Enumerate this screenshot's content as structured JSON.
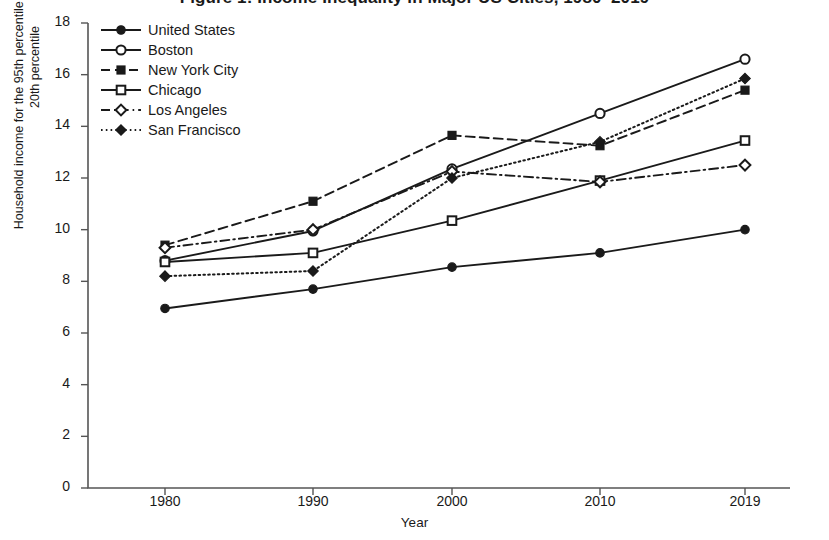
{
  "figure": {
    "title": "Figure 1: Income Inequality in Major US Cities, 1980–2019",
    "xlabel": "Year",
    "ylabel_line1": "Household income for the 95th percentile as a share of the",
    "ylabel_line2": "20th percentile"
  },
  "axes": {
    "y_ticks": [
      "18",
      "16",
      "14",
      "12",
      "10",
      "8",
      "6",
      "4",
      "2",
      "0"
    ],
    "x_ticks": [
      "1980",
      "1990",
      "2000",
      "2010",
      "2019"
    ]
  },
  "colors": {
    "line": "#1a1a1a",
    "background": "#ffffff",
    "axis": "#555555",
    "text": "#1a1a1a"
  },
  "legend": {
    "items": [
      {
        "label": "United States",
        "marker": "filled-circle",
        "dash": "solid"
      },
      {
        "label": "Boston",
        "marker": "open-circle",
        "dash": "solid"
      },
      {
        "label": "New York City",
        "marker": "filled-square",
        "dash": "dashed"
      },
      {
        "label": "Chicago",
        "marker": "open-square",
        "dash": "solid"
      },
      {
        "label": "Los Angeles",
        "marker": "open-diamond",
        "dash": "dash-dot"
      },
      {
        "label": "San Francisco",
        "marker": "filled-diamond",
        "dash": "dotted"
      }
    ]
  },
  "chart_data": {
    "type": "line",
    "title": "Figure 1: Income Inequality in Major US Cities, 1980–2019",
    "xlabel": "Year",
    "ylabel": "Household income for the 95th percentile as a share of the 20th percentile",
    "x": [
      1980,
      1990,
      2000,
      2010,
      2019
    ],
    "xtick_labels": [
      "1980",
      "1990",
      "2000",
      "2010",
      "2019"
    ],
    "ylim": [
      0,
      18
    ],
    "ytick_values": [
      0,
      2,
      4,
      6,
      8,
      10,
      12,
      14,
      16,
      18
    ],
    "grid": false,
    "legend_position": "upper-left",
    "series": [
      {
        "name": "United States",
        "marker": "filled-circle",
        "dash": "solid",
        "values": [
          6.95,
          7.7,
          8.55,
          9.1,
          10.0
        ]
      },
      {
        "name": "Boston",
        "marker": "open-circle",
        "dash": "solid",
        "values": [
          8.8,
          9.95,
          12.35,
          14.5,
          16.6
        ]
      },
      {
        "name": "New York City",
        "marker": "filled-square",
        "dash": "dashed",
        "values": [
          9.4,
          11.1,
          13.65,
          13.25,
          15.4
        ]
      },
      {
        "name": "Chicago",
        "marker": "open-square",
        "dash": "solid",
        "values": [
          8.75,
          9.1,
          10.35,
          11.9,
          13.45
        ]
      },
      {
        "name": "Los Angeles",
        "marker": "open-diamond",
        "dash": "dash-dot",
        "values": [
          9.3,
          10.0,
          12.25,
          11.85,
          12.5
        ]
      },
      {
        "name": "San Francisco",
        "marker": "filled-diamond",
        "dash": "dotted",
        "values": [
          8.2,
          8.4,
          12.0,
          13.4,
          15.85
        ]
      }
    ]
  }
}
